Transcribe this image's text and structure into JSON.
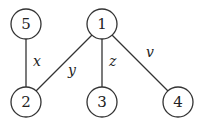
{
  "graph": {
    "nodes": [
      {
        "id": "5",
        "label": "5",
        "cx": 26,
        "cy": 24
      },
      {
        "id": "1",
        "label": "1",
        "cx": 102,
        "cy": 24
      },
      {
        "id": "2",
        "label": "2",
        "cx": 26,
        "cy": 102
      },
      {
        "id": "3",
        "label": "3",
        "cx": 102,
        "cy": 102
      },
      {
        "id": "4",
        "label": "4",
        "cx": 178,
        "cy": 102
      }
    ],
    "edges": [
      {
        "from": "5",
        "to": "2",
        "label": "x"
      },
      {
        "from": "1",
        "to": "2",
        "label": "y"
      },
      {
        "from": "1",
        "to": "3",
        "label": "z"
      },
      {
        "from": "1",
        "to": "4",
        "label": "v"
      }
    ]
  },
  "colors": {
    "stroke": "#333333",
    "background": "#ffffff"
  }
}
